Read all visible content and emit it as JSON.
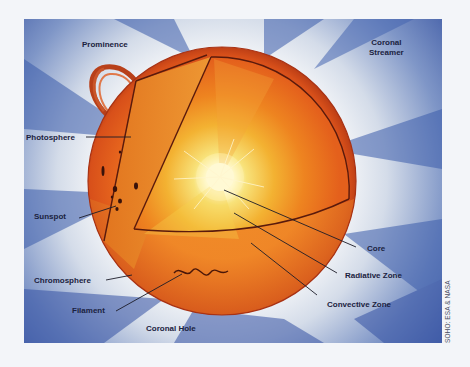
{
  "diagram": {
    "labels": {
      "prominence": "Prominence",
      "coronal_streamer_line1": "Coronal",
      "coronal_streamer_line2": "Streamer",
      "photosphere": "Photosphere",
      "sunspot": "Sunspot",
      "chromosphere": "Chromosphere",
      "filament": "Filament",
      "coronal_hole": "Coronal Hole",
      "core": "Core",
      "radiative_zone": "Radiative Zone",
      "convective_zone": "Convective Zone"
    },
    "credit": "SOHO: ESA & NASA",
    "colors": {
      "corona_blue": "#3a5aa8",
      "corona_light": "#dfe6ef",
      "sun_outer": "#d9501c",
      "photosphere_band": "#e88a2a",
      "convective_zone": "#e0601e",
      "radiative_zone": "#f08a1c",
      "core_glow": "#fff6c8",
      "label_text": "#1b2240",
      "leader_line": "#1c1c28",
      "page_background": "#f3f5f9"
    }
  }
}
